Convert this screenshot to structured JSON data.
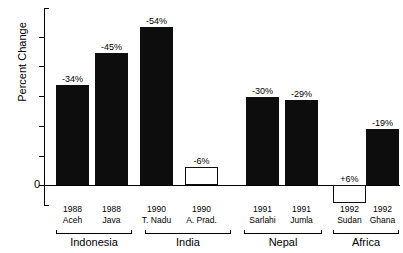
{
  "chart_data": {
    "type": "bar",
    "title": "",
    "xlabel": "",
    "ylabel": "Percent Change",
    "ylim": [
      -60,
      12
    ],
    "grid": false,
    "legend": "none",
    "zero_tick_label": "0",
    "y_tick_labels": [
      "",
      "",
      "",
      "",
      "",
      "",
      "0",
      ""
    ],
    "note": "Bars rise upward for negative percent change; bars below the zero line are positive.",
    "categories": [
      "1988 Aceh",
      "1988 Java",
      "1990 T. Nadu",
      "1990 A. Prad.",
      "1991 Sarlahi",
      "1991 Jumla",
      "1992 Sudan",
      "1992 Ghana"
    ],
    "values": [
      -34,
      -45,
      -54,
      -6,
      -30,
      -29,
      6,
      -19
    ],
    "data_labels": [
      "-34%",
      "-45%",
      "-54%",
      "-6%",
      "-30%",
      "-29%",
      "+6%",
      "-19%"
    ],
    "bars": [
      {
        "year": "1988",
        "place": "Aceh",
        "label": "-34%",
        "value": -34,
        "style": "solid",
        "group": "Indonesia"
      },
      {
        "year": "1988",
        "place": "Java",
        "label": "-45%",
        "value": -45,
        "style": "solid",
        "group": "Indonesia"
      },
      {
        "year": "1990",
        "place": "T. Nadu",
        "label": "-54%",
        "value": -54,
        "style": "solid",
        "group": "India"
      },
      {
        "year": "1990",
        "place": "A. Prad.",
        "label": "-6%",
        "value": -6,
        "style": "hollow",
        "group": "India"
      },
      {
        "year": "1991",
        "place": "Sarlahi",
        "label": "-30%",
        "value": -30,
        "style": "solid",
        "group": "Nepal"
      },
      {
        "year": "1991",
        "place": "Jumla",
        "label": "-29%",
        "value": -29,
        "style": "solid",
        "group": "Nepal"
      },
      {
        "year": "1992",
        "place": "Sudan",
        "label": "+6%",
        "value": 6,
        "style": "hollow",
        "group": "Africa"
      },
      {
        "year": "1992",
        "place": "Ghana",
        "label": "-19%",
        "value": -19,
        "style": "solid",
        "group": "Africa"
      }
    ],
    "groups": [
      "Indonesia",
      "India",
      "Nepal",
      "Africa"
    ],
    "colors": {
      "bar_fill": "#0d0d0d",
      "bar_outline": "#0d0d0d",
      "hollow_fill": "#ffffff",
      "axis": "#000000",
      "background": "#ffffff"
    }
  }
}
